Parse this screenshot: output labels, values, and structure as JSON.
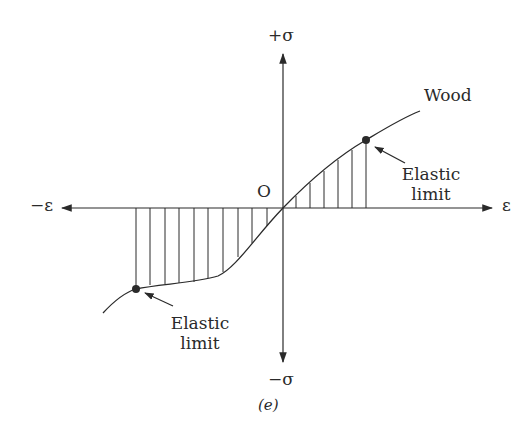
{
  "figure": {
    "caption": "(e)",
    "axes": {
      "y_positive_label": "+σ",
      "y_negative_label": "−σ",
      "x_positive_label": "ε",
      "x_negative_label": "−ε",
      "origin_label": "O"
    },
    "curve_label": "Wood",
    "annotations": [
      {
        "id": "upper-elastic-limit",
        "line1": "Elastic",
        "line2": "limit"
      },
      {
        "id": "lower-elastic-limit",
        "line1": "Elastic",
        "line2": "limit"
      }
    ],
    "colors": {
      "ink": "#2a2a2a",
      "background": "#ffffff"
    }
  }
}
